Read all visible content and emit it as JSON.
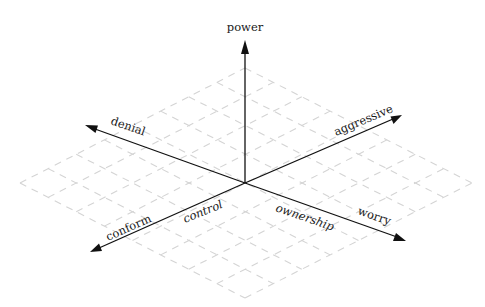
{
  "diagram": {
    "type": "3d-axes-with-isometric-grid",
    "origin": {
      "x": 245,
      "y": 183
    },
    "grid": {
      "color": "#d4d4d4",
      "style": "dashed",
      "top": {
        "x": 245,
        "y": 68
      },
      "right": {
        "x": 472,
        "y": 183
      },
      "bottom": {
        "x": 245,
        "y": 298
      },
      "left": {
        "x": 20,
        "y": 183
      },
      "divisions": 8
    },
    "axes": [
      {
        "id": "power",
        "label": "power",
        "italic": false,
        "tip": {
          "x": 245,
          "y": 40
        }
      },
      {
        "id": "denial",
        "label": "denial",
        "italic": false,
        "tip": {
          "x": 85,
          "y": 125
        }
      },
      {
        "id": "aggressive",
        "label": "aggressive",
        "italic": false,
        "tip": {
          "x": 402,
          "y": 115
        }
      },
      {
        "id": "conform",
        "label": "conform",
        "italic": false,
        "tip": {
          "x": 90,
          "y": 252
        }
      },
      {
        "id": "worry",
        "label": "worry",
        "italic": false,
        "tip": {
          "x": 406,
          "y": 241
        }
      }
    ],
    "labels": {
      "power": "power",
      "denial": "denial",
      "aggressive": "aggressive",
      "conform": "conform",
      "worry": "worry",
      "control": "control",
      "ownership": "ownership"
    },
    "plane_labels": [
      {
        "text": "control",
        "italic": true
      },
      {
        "text": "ownership",
        "italic": true
      }
    ],
    "colors": {
      "axis": "#111111",
      "label": "#1a1a1a",
      "grid": "#d4d4d4",
      "background": "#ffffff"
    }
  }
}
